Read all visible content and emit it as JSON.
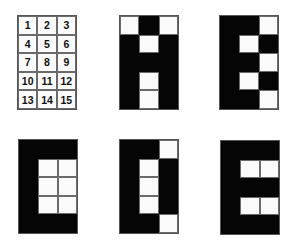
{
  "figure": {
    "colors": {
      "on": "#050505",
      "off": "#fafafa",
      "gridline": "#6a6a6a"
    },
    "grid_size": {
      "cols": 3,
      "rows": 5
    },
    "panels": [
      {
        "name": "numbered-index-grid",
        "type": "index",
        "cells": [
          "1",
          "2",
          "3",
          "4",
          "5",
          "6",
          "7",
          "8",
          "9",
          "10",
          "11",
          "12",
          "13",
          "14",
          "15"
        ]
      },
      {
        "name": "letter-a-pattern",
        "type": "pattern",
        "pattern": [
          0,
          1,
          0,
          1,
          0,
          1,
          1,
          1,
          1,
          1,
          0,
          1,
          1,
          0,
          1
        ]
      },
      {
        "name": "letter-b-pattern",
        "type": "pattern",
        "pattern": [
          1,
          1,
          0,
          1,
          0,
          1,
          1,
          1,
          0,
          1,
          0,
          1,
          1,
          1,
          0
        ]
      },
      {
        "name": "letter-c-pattern",
        "type": "pattern",
        "pattern": [
          1,
          1,
          1,
          1,
          0,
          0,
          1,
          0,
          0,
          1,
          0,
          0,
          1,
          1,
          1
        ]
      },
      {
        "name": "letter-d-pattern",
        "type": "pattern",
        "pattern": [
          1,
          1,
          0,
          1,
          0,
          1,
          1,
          0,
          1,
          1,
          0,
          1,
          1,
          1,
          0
        ]
      },
      {
        "name": "letter-e-pattern",
        "type": "pattern",
        "pattern": [
          1,
          1,
          1,
          1,
          0,
          0,
          1,
          1,
          1,
          1,
          0,
          0,
          1,
          1,
          1
        ]
      }
    ]
  }
}
